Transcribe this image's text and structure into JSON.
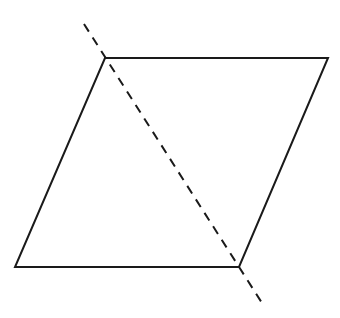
{
  "diagram": {
    "type": "geometry",
    "shape": "parallelogram",
    "stroke_color": "#1a1a1a",
    "background": "#ffffff",
    "vertices": {
      "top_left": [
        105,
        58
      ],
      "top_right": [
        328,
        58
      ],
      "bottom_right": [
        239,
        267
      ],
      "bottom_left": [
        15,
        267
      ]
    },
    "diagonal_line": {
      "style": "dashed",
      "start": [
        84,
        24
      ],
      "end": [
        262,
        303
      ],
      "description": "dashed line through top-left and bottom-right vertices"
    }
  }
}
